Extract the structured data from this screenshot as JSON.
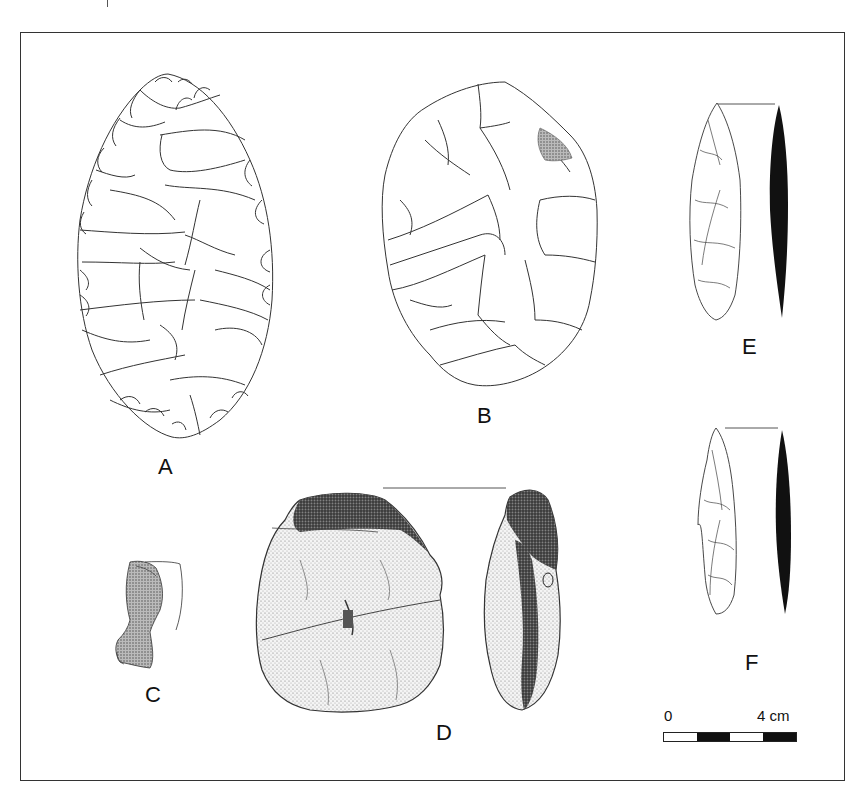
{
  "figure": {
    "artifacts": [
      {
        "id": "A",
        "label": "A",
        "type": "bifacial leaf-shaped handaxe",
        "style": "line drawing"
      },
      {
        "id": "B",
        "label": "B",
        "type": "ovate biface",
        "style": "line drawing"
      },
      {
        "id": "C",
        "label": "C",
        "type": "small fragment with profile outline",
        "style": "stippled"
      },
      {
        "id": "D",
        "label": "D",
        "type": "cortical nodule face and profile",
        "style": "stippled"
      },
      {
        "id": "E",
        "label": "E",
        "type": "elongated point with section",
        "style": "line drawing + solid section"
      },
      {
        "id": "F",
        "label": "F",
        "type": "elongated point with section",
        "style": "line drawing + solid section"
      }
    ],
    "scale_bar": {
      "start_label": "0",
      "end_label": "4 cm",
      "segments": [
        "white",
        "black",
        "white",
        "black"
      ],
      "colors": {
        "white": "#ffffff",
        "black": "#111111"
      }
    },
    "colors": {
      "frame": "#333333",
      "line": "#333333",
      "section_fill": "#111111",
      "background": "#ffffff"
    }
  }
}
